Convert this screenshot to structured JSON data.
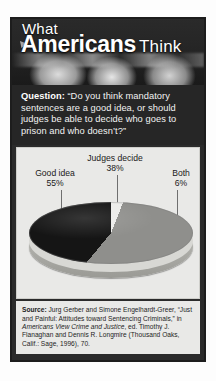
{
  "header": {
    "title_line1": "What",
    "title_main": "Americans",
    "title_line2": "Think"
  },
  "question": {
    "label": "Question:",
    "text": " “Do you think mandatory sentences are a good idea, or should judges be able to decide who goes to prison and who doesn’t?”"
  },
  "chart_data": {
    "type": "pie",
    "title": "",
    "categories": [
      "Good idea",
      "Judges decide",
      "Both"
    ],
    "values": [
      55,
      38,
      6
    ],
    "value_labels": [
      "55%",
      "38%",
      "6%"
    ],
    "colors": [
      "#8f8f8c",
      "#151515",
      "#ececea"
    ],
    "legend": "labels-with-leader-lines",
    "three_d": true
  },
  "labels": {
    "good": {
      "name": "Good idea",
      "pct": "55%"
    },
    "judges": {
      "name": "Judges decide",
      "pct": "38%"
    },
    "both": {
      "name": "Both",
      "pct": "6%"
    }
  },
  "source": {
    "label": "Source:",
    "part1": " Jurg Gerber and Simone Engelhardt-Greer, “Just and Painful: Attitudes toward Sentencing Criminals,” in ",
    "italic": "Americans View Crime and Justice",
    "part2": ", ed. Timothy J. Flanaghan and Dennis R. Longmire (Thousand Oaks, Calif.: Sage, 1996), 70."
  }
}
